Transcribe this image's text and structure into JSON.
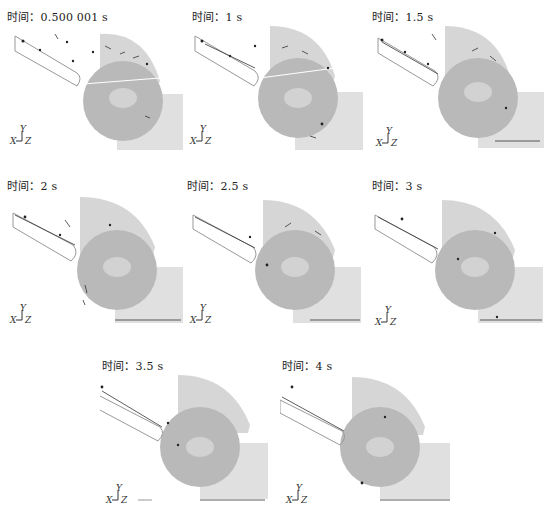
{
  "figure": {
    "time_label_prefix": "时间：",
    "axis_triad": {
      "x": "X",
      "y": "Y",
      "z": "Z"
    },
    "colors": {
      "drum_fill": "#b7b7b7",
      "housing_fill": "#d4d4d4",
      "box_fill": "#dcdcdc",
      "particle": "#222222",
      "chute_outline": "#999999"
    },
    "panels": [
      {
        "label": "时间：0.500 001 s",
        "time": "0.500 001 s"
      },
      {
        "label": "时间：1 s",
        "time": "1 s"
      },
      {
        "label": "时间：1.5 s",
        "time": "1.5 s"
      },
      {
        "label": "时间：2 s",
        "time": "2 s"
      },
      {
        "label": "时间：2.5 s",
        "time": "2.5 s"
      },
      {
        "label": "时间：3 s",
        "time": "3 s"
      },
      {
        "label": "时间：3.5 s",
        "time": "3.5 s"
      },
      {
        "label": "时间：4 s",
        "time": "4 s"
      }
    ]
  }
}
